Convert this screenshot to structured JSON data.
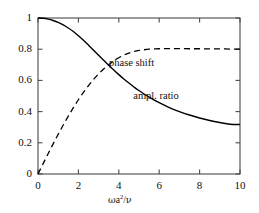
{
  "chart_data": {
    "type": "line",
    "title": "",
    "subtitle": "",
    "xlabel": "ωa²/ν",
    "ylabel": "",
    "xlim": [
      0,
      10
    ],
    "ylim": [
      0,
      1
    ],
    "grid": false,
    "legend_position": "inline-annotations",
    "xticks": [
      0,
      2,
      4,
      6,
      8,
      10
    ],
    "xtick_labels": [
      "0",
      "2",
      "4",
      "6",
      "8",
      "10"
    ],
    "yticks": [
      0,
      0.2,
      0.4,
      0.6,
      0.8,
      1
    ],
    "ytick_labels": [
      "0",
      "0.2",
      "0.4",
      "0.6",
      "0.8",
      "1"
    ],
    "annotations": [
      {
        "text": "phase shift",
        "x": 5.0,
        "y": 0.71
      },
      {
        "text": "ampl. ratio",
        "x": 6.2,
        "y": 0.5
      }
    ],
    "series": [
      {
        "name": "ampl. ratio",
        "style": "solid",
        "color": "#000000",
        "x": [
          0,
          0.25,
          0.5,
          0.75,
          1.0,
          1.25,
          1.5,
          1.75,
          2.0,
          2.25,
          2.5,
          2.75,
          3.0,
          3.25,
          3.5,
          3.75,
          4.0,
          4.25,
          4.5,
          4.75,
          5.0,
          5.5,
          6.0,
          6.5,
          7.0,
          7.5,
          8.0,
          8.5,
          9.0,
          9.5,
          10.0
        ],
        "values": [
          1.0,
          0.998,
          0.993,
          0.984,
          0.972,
          0.956,
          0.936,
          0.913,
          0.886,
          0.857,
          0.826,
          0.794,
          0.761,
          0.729,
          0.697,
          0.666,
          0.637,
          0.609,
          0.583,
          0.558,
          0.535,
          0.493,
          0.457,
          0.426,
          0.4,
          0.378,
          0.359,
          0.343,
          0.33,
          0.319,
          0.317
        ]
      },
      {
        "name": "phase shift",
        "style": "dashed",
        "color": "#000000",
        "x": [
          0,
          0.25,
          0.5,
          0.75,
          1.0,
          1.25,
          1.5,
          1.75,
          2.0,
          2.25,
          2.5,
          2.75,
          3.0,
          3.25,
          3.5,
          3.75,
          4.0,
          4.25,
          4.5,
          4.75,
          5.0,
          5.5,
          6.0,
          6.5,
          7.0,
          7.5,
          8.0,
          8.5,
          9.0,
          9.5,
          10.0
        ],
        "values": [
          0.0,
          0.065,
          0.13,
          0.193,
          0.255,
          0.314,
          0.371,
          0.425,
          0.476,
          0.523,
          0.566,
          0.606,
          0.642,
          0.673,
          0.701,
          0.725,
          0.745,
          0.762,
          0.775,
          0.785,
          0.792,
          0.8,
          0.803,
          0.804,
          0.804,
          0.803,
          0.803,
          0.802,
          0.802,
          0.801,
          0.801
        ]
      }
    ],
    "crossing_point": {
      "x": 2.9,
      "y": 0.66
    }
  },
  "figure": {
    "frame_color": "#4a4a4a",
    "background": "#ffffff"
  }
}
